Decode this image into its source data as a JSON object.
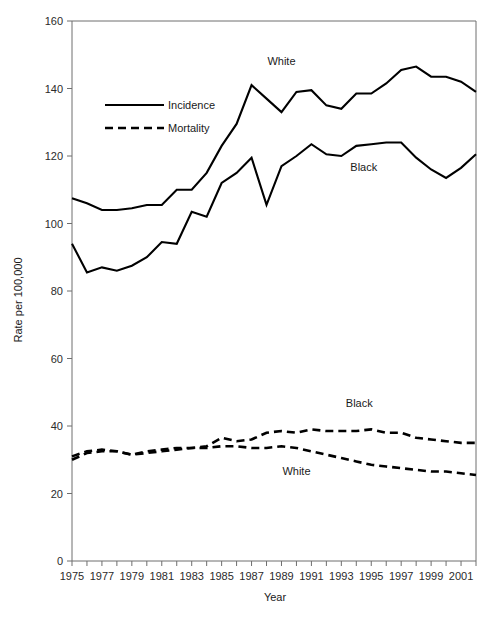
{
  "chart_data": {
    "type": "line",
    "title": "",
    "xlabel": "Year",
    "ylabel": "Rate per 100,000",
    "xlim": [
      1975,
      2002
    ],
    "ylim": [
      0,
      160
    ],
    "ytick_step": 20,
    "xtick_step": 1,
    "xtick_label_step": 2,
    "grid": false,
    "legend_position": "upper-left-inside",
    "x": [
      1975,
      1976,
      1977,
      1978,
      1979,
      1980,
      1981,
      1982,
      1983,
      1984,
      1985,
      1986,
      1987,
      1988,
      1989,
      1990,
      1991,
      1992,
      1993,
      1994,
      1995,
      1996,
      1997,
      1998,
      1999,
      2000,
      2001,
      2002
    ],
    "yticks": [
      0,
      20,
      40,
      60,
      80,
      100,
      120,
      140,
      160
    ],
    "xticklabels": [
      "1975",
      "1977",
      "1979",
      "1981",
      "1983",
      "1985",
      "1987",
      "1989",
      "1991",
      "1993",
      "1995",
      "1997",
      "1999",
      "2001"
    ],
    "legend": [
      {
        "name": "Incidence",
        "style": "solid"
      },
      {
        "name": "Mortality",
        "style": "dashed"
      }
    ],
    "annotations": [
      {
        "text": "White",
        "series": "White Incidence",
        "x": 1989.0,
        "y": 147.0
      },
      {
        "text": "Black",
        "series": "Black Incidence",
        "x": 1994.5,
        "y": 115.5
      },
      {
        "text": "Black",
        "series": "Black Mortality",
        "x": 1994.2,
        "y": 45.5
      },
      {
        "text": "White",
        "series": "White Mortality",
        "x": 1990.0,
        "y": 25.5
      }
    ],
    "series": [
      {
        "name": "White Incidence",
        "style": "solid",
        "values": [
          107.5,
          106.0,
          104.0,
          104.0,
          104.5,
          105.5,
          105.5,
          110.0,
          110.0,
          115.0,
          123.0,
          129.5,
          141.0,
          137.0,
          133.0,
          139.0,
          139.5,
          135.0,
          134.0,
          138.5,
          138.5,
          141.5,
          145.5,
          146.5,
          143.5,
          143.5,
          142.0,
          139.0
        ]
      },
      {
        "name": "Black Incidence",
        "style": "solid",
        "values": [
          94.0,
          85.5,
          87.0,
          86.0,
          87.5,
          90.0,
          94.5,
          94.0,
          103.5,
          102.0,
          112.0,
          115.0,
          119.5,
          105.5,
          117.0,
          120.0,
          123.5,
          120.5,
          120.0,
          123.0,
          123.5,
          124.0,
          124.0,
          119.5,
          116.0,
          113.5,
          116.5,
          120.5
        ]
      },
      {
        "name": "Black Mortality",
        "style": "dashed",
        "values": [
          31.0,
          32.5,
          33.0,
          32.5,
          31.5,
          32.0,
          32.5,
          33.0,
          33.5,
          34.0,
          36.5,
          35.5,
          36.0,
          38.0,
          38.5,
          38.0,
          39.0,
          38.5,
          38.5,
          38.5,
          39.0,
          38.0,
          38.0,
          36.5,
          36.0,
          35.5,
          35.0,
          35.0
        ]
      },
      {
        "name": "White Mortality",
        "style": "dashed",
        "values": [
          30.0,
          32.0,
          32.5,
          32.5,
          31.5,
          32.5,
          33.0,
          33.5,
          33.5,
          33.5,
          34.0,
          34.0,
          33.5,
          33.5,
          34.0,
          33.5,
          32.5,
          31.5,
          30.5,
          29.5,
          28.5,
          28.0,
          27.5,
          27.0,
          26.5,
          26.5,
          26.0,
          25.5
        ]
      }
    ]
  }
}
